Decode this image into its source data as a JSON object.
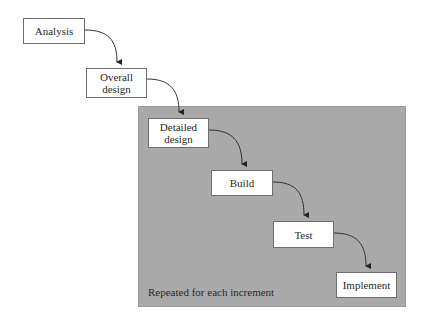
{
  "diagram": {
    "type": "incremental-waterfall",
    "region": {
      "label": "Repeated for each increment",
      "fill_color": "#a9a9a9"
    },
    "nodes": [
      {
        "id": "analysis",
        "label": "Analysis"
      },
      {
        "id": "overall-design",
        "label": "Overall\ndesign"
      },
      {
        "id": "detailed-design",
        "label": "Detailed\ndesign"
      },
      {
        "id": "build",
        "label": "Build"
      },
      {
        "id": "test",
        "label": "Test"
      },
      {
        "id": "implement",
        "label": "Implement"
      }
    ],
    "edges": [
      {
        "from": "analysis",
        "to": "overall-design"
      },
      {
        "from": "overall-design",
        "to": "detailed-design"
      },
      {
        "from": "detailed-design",
        "to": "build"
      },
      {
        "from": "build",
        "to": "test"
      },
      {
        "from": "test",
        "to": "implement"
      }
    ]
  }
}
